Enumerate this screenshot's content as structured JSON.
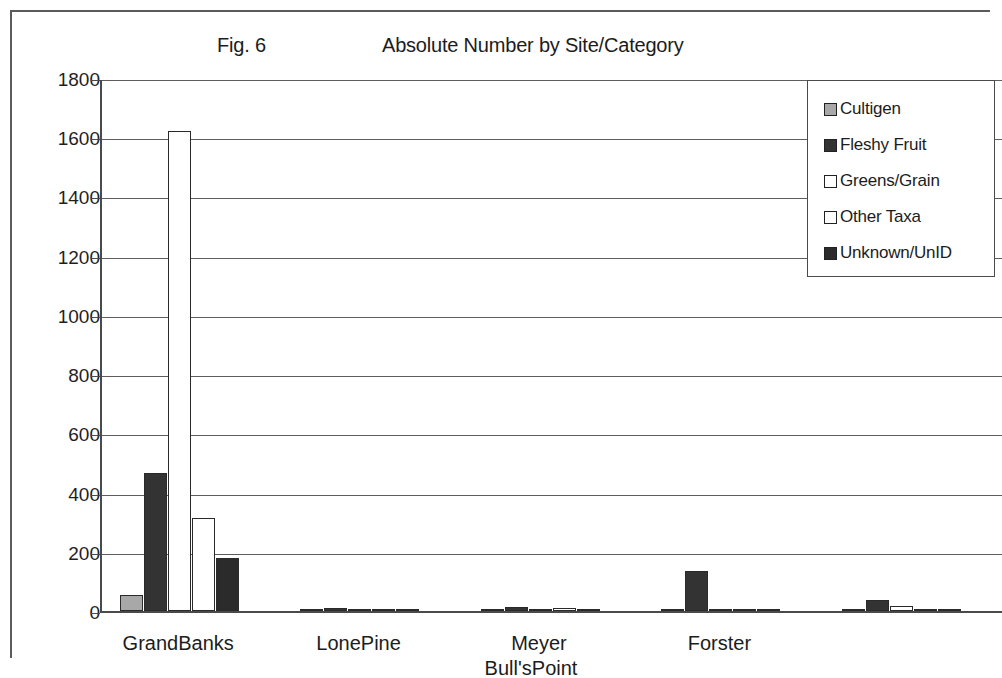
{
  "figure": {
    "fig_label": "Fig. 6",
    "title": "Absolute Number by Site/Category"
  },
  "legend": {
    "position": "top-right",
    "items": [
      {
        "label": "Cultigen",
        "color": "#a8a8a8"
      },
      {
        "label": "Fleshy Fruit",
        "color": "#333333"
      },
      {
        "label": "Greens/Grain",
        "color": "#ffffff"
      },
      {
        "label": "Other Taxa",
        "color": "#ffffff"
      },
      {
        "label": "Unknown/UnID",
        "color": "#2b2b2b"
      }
    ]
  },
  "axes": {
    "y_ticks": [
      "1800",
      "1600",
      "1400",
      "1200",
      "1000",
      "800",
      "600",
      "400",
      "200",
      "0"
    ],
    "x_labels_row1": [
      "GrandBanks",
      "LonePine",
      "Meyer",
      "Forster"
    ],
    "x_labels_row2": [
      "Bull'sPoint"
    ]
  },
  "chart_data": {
    "type": "bar",
    "title": "Absolute Number by Site/Category",
    "fig_label": "Fig. 6",
    "xlabel": "",
    "ylabel": "",
    "ylim": [
      0,
      1800
    ],
    "ytick_step": 200,
    "grid": true,
    "legend_position": "top-right",
    "categories": [
      "GrandBanks",
      "LonePine",
      "Meyer",
      "Forster",
      "Bull'sPoint"
    ],
    "series": [
      {
        "name": "Cultigen",
        "color": "#a8a8a8",
        "values": [
          53,
          2,
          3,
          2,
          2
        ]
      },
      {
        "name": "Fleshy Fruit",
        "color": "#333333",
        "values": [
          465,
          10,
          12,
          135,
          38
        ]
      },
      {
        "name": "Greens/Grain",
        "color": "#ffffff",
        "values": [
          1620,
          4,
          8,
          3,
          18
        ]
      },
      {
        "name": "Other Taxa",
        "color": "#ffffff",
        "values": [
          313,
          3,
          9,
          8,
          8
        ]
      },
      {
        "name": "Unknown/UnID",
        "color": "#2b2b2b",
        "values": [
          178,
          2,
          4,
          2,
          2
        ]
      }
    ]
  }
}
